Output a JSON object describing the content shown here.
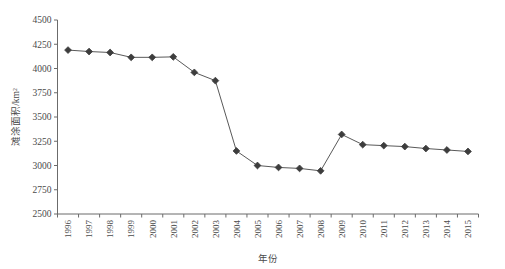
{
  "chart_data": {
    "type": "line",
    "title": "",
    "xlabel": "年份",
    "ylabel": "滩涂面积/km²",
    "categories": [
      "1996",
      "1997",
      "1998",
      "1999",
      "2000",
      "2001",
      "2002",
      "2003",
      "2004",
      "2005",
      "2006",
      "2007",
      "2008",
      "2009",
      "2010",
      "2011",
      "2012",
      "2013",
      "2014",
      "2015"
    ],
    "values": [
      4190,
      4175,
      4165,
      4115,
      4115,
      4120,
      3960,
      3875,
      3150,
      3000,
      2980,
      2970,
      2945,
      3320,
      3215,
      3205,
      3195,
      3175,
      3160,
      3145
    ],
    "series": [
      {
        "name": "滩涂面积",
        "values": [
          4190,
          4175,
          4165,
          4115,
          4115,
          4120,
          3960,
          3875,
          3150,
          3000,
          2980,
          2970,
          2945,
          3320,
          3215,
          3205,
          3195,
          3175,
          3160,
          3145
        ]
      }
    ],
    "ylim": [
      2500,
      4500
    ],
    "ytick_labels": [
      "2500",
      "2750",
      "3000",
      "3250",
      "3500",
      "3750",
      "4000",
      "4250",
      "4500"
    ],
    "ytick_values": [
      2500,
      2750,
      3000,
      3250,
      3500,
      3750,
      4000,
      4250,
      4500
    ],
    "ytick_step": 250,
    "grid": false,
    "legend": null,
    "legend_position": "none",
    "marker": "diamond",
    "line_color": "#595959",
    "marker_color": "#3d3d3d",
    "axis_color": "#6b6b6b",
    "background_color": "#ffffff",
    "xtick_rotation": "vertical"
  }
}
